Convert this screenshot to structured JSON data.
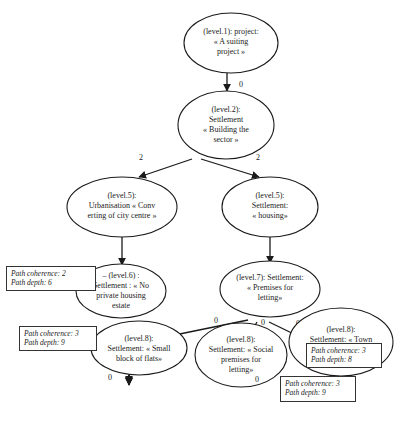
{
  "diagram": {
    "nodes": [
      {
        "id": "n1",
        "lines": [
          "(level.1): project:",
          "« A suiting",
          "project »"
        ],
        "cx": 231,
        "cy": 43,
        "rx": 47,
        "ry": 30
      },
      {
        "id": "n2",
        "lines": [
          "(level.2):",
          "Settlement",
          "« Building the",
          "sector »"
        ],
        "cx": 199,
        "cy": 125,
        "rx": 48,
        "ry": 34
      },
      {
        "id": "n3",
        "lines": [
          "(level.5):",
          "Urbanisation « Conv",
          "erting of city centre »"
        ],
        "cx": 126,
        "cy": 207,
        "rx": 50,
        "ry": 30
      },
      {
        "id": "n4",
        "lines": [
          "(level.5):",
          "Settlement:",
          "« housing»"
        ],
        "cx": 272,
        "cy": 207,
        "rx": 47,
        "ry": 30
      },
      {
        "id": "n5",
        "lines": [
          "– (level.6) :",
          "Settlement : « No",
          "private housing",
          "estate"
        ],
        "cx": 122,
        "cy": 297,
        "rx": 45,
        "ry": 32
      },
      {
        "id": "n6",
        "lines": [
          "(level.7): Settlement:",
          "« Premises for",
          "letting»"
        ],
        "cx": 270,
        "cy": 293,
        "rx": 50,
        "ry": 30
      },
      {
        "id": "n7",
        "lines": [
          "(level.8):",
          "Settlement: « Small",
          "block of flats»"
        ],
        "cx": 143,
        "cy": 365,
        "rx": 46,
        "ry": 31
      },
      {
        "id": "n8",
        "lines": [
          "(level.8):",
          "Settlement: « Social",
          "premises for",
          "letting»"
        ],
        "cx": 215,
        "cy": 365,
        "rx": 45,
        "ry": 34
      },
      {
        "id": "n9",
        "lines": [
          "(level.8):",
          "Settlement: « Town",
          "council's premises",
          "for letting»"
        ],
        "cx": 343,
        "cy": 364,
        "rx": 52,
        "ry": 36
      },
      {
        "id": "n10",
        "lines": [
          "(level.9):",
          "Settlement:",
          "« Building a max of",
          "two or three floors»"
        ],
        "cx": 128,
        "cy": 402,
        "rx": 46,
        "ry": 32
      },
      {
        "id": "n11",
        "lines": [
          "(level.9): « Some",
          "Social premises for",
          "letting »"
        ],
        "cx": 232,
        "cy": 395,
        "rx": 48,
        "ry": 27
      }
    ],
    "edges": [
      {
        "from": "n1",
        "to": "n2",
        "label": "0"
      },
      {
        "from": "n2",
        "to": "n3",
        "label": "2"
      },
      {
        "from": "n2",
        "to": "n4",
        "label": "2"
      },
      {
        "from": "n3",
        "to": "n5",
        "label": "0"
      },
      {
        "from": "n4",
        "to": "n6",
        "label": "1"
      },
      {
        "from": "n6",
        "to": "n7",
        "label": "0"
      },
      {
        "from": "n6",
        "to": "n8",
        "label": "0"
      },
      {
        "from": "n6",
        "to": "n9",
        "label": "0"
      },
      {
        "from": "n7",
        "to": "n10",
        "label": "0"
      },
      {
        "from": "n8",
        "to": "n11",
        "label": "0"
      }
    ],
    "notes": [
      {
        "coherence": "Path coherence: 2",
        "depth": "Path depth: 6"
      },
      {
        "coherence": "Path coherence: 3",
        "depth": "Path depth:  9"
      },
      {
        "coherence": "Path coherence: 3",
        "depth": "Path depth: 8"
      },
      {
        "coherence": "Path coherence: 3",
        "depth": "Path depth: 9"
      }
    ]
  }
}
